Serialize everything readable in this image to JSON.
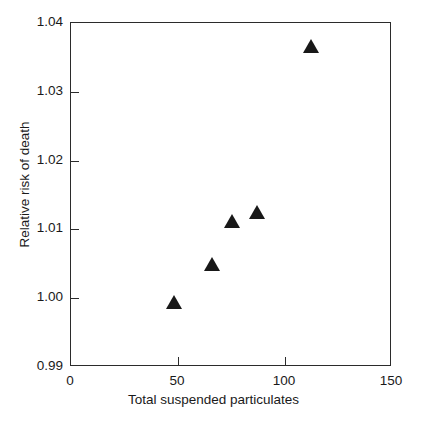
{
  "chart_data": {
    "type": "scatter",
    "title": "",
    "xlabel": "Total suspended particulates",
    "ylabel": "Relative risk of death",
    "xlim": [
      0,
      150
    ],
    "ylim": [
      0.99,
      1.04
    ],
    "xticks": [
      "0",
      "50",
      "100",
      "150"
    ],
    "xtick_values": [
      0,
      50,
      100,
      150
    ],
    "yticks": [
      "0.99",
      "1.00",
      "1.01",
      "1.02",
      "1.03",
      "1.04"
    ],
    "ytick_values": [
      0.99,
      1.0,
      1.01,
      1.02,
      1.03,
      1.04
    ],
    "grid": false,
    "legend": null,
    "marker": "triangle-up",
    "marker_color": "#181818",
    "series": [
      {
        "name": "Relative risk of death",
        "points": [
          {
            "x": 48,
            "y": 0.9995
          },
          {
            "x": 66,
            "y": 1.005
          },
          {
            "x": 75,
            "y": 1.0112
          },
          {
            "x": 87,
            "y": 1.0125
          },
          {
            "x": 112,
            "y": 1.0366
          }
        ]
      }
    ]
  },
  "axes": {
    "frame_color": "#2b2b2b"
  }
}
